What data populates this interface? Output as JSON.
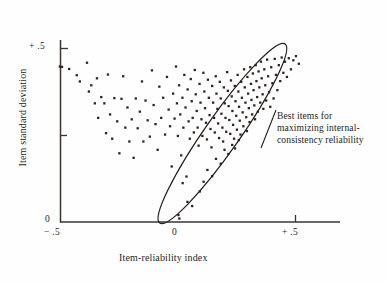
{
  "chart_data": {
    "type": "scatter",
    "title": "",
    "subtitle": "",
    "xlabel": "Item-reliability index",
    "ylabel": "Item standard deviation",
    "xlim": [
      -0.55,
      0.59
    ],
    "ylim": [
      0,
      0.515
    ],
    "grid": false,
    "legend_position": "none",
    "x_ticks": [
      -0.5,
      0,
      0.5
    ],
    "x_tick_labels": [
      "− .5",
      "0",
      "+ .5"
    ],
    "y_ticks": [
      0,
      0.25,
      0.5
    ],
    "y_tick_labels": [
      "0",
      "",
      "+ .5"
    ],
    "point_count": 191,
    "marker": "small filled square",
    "marker_color": "#2b2624",
    "points": [
      [
        -0.488,
        0.448
      ],
      [
        -0.479,
        0.447
      ],
      [
        -0.449,
        0.441
      ],
      [
        -0.417,
        0.423
      ],
      [
        -0.404,
        0.405
      ],
      [
        -0.374,
        0.459
      ],
      [
        -0.366,
        0.376
      ],
      [
        -0.356,
        0.394
      ],
      [
        -0.341,
        0.342
      ],
      [
        -0.332,
        0.414
      ],
      [
        -0.327,
        0.3
      ],
      [
        -0.314,
        0.36
      ],
      [
        -0.301,
        0.342
      ],
      [
        -0.294,
        0.256
      ],
      [
        -0.286,
        0.425
      ],
      [
        -0.277,
        0.31
      ],
      [
        -0.268,
        0.24
      ],
      [
        -0.259,
        0.357
      ],
      [
        -0.247,
        0.29
      ],
      [
        -0.238,
        0.198
      ],
      [
        -0.229,
        0.355
      ],
      [
        -0.222,
        0.42
      ],
      [
        -0.213,
        0.272
      ],
      [
        -0.204,
        0.33
      ],
      [
        -0.196,
        0.232
      ],
      [
        -0.186,
        0.296
      ],
      [
        -0.178,
        0.185
      ],
      [
        -0.169,
        0.356
      ],
      [
        -0.161,
        0.27
      ],
      [
        -0.152,
        0.318
      ],
      [
        -0.143,
        0.405
      ],
      [
        -0.137,
        0.232
      ],
      [
        -0.128,
        0.35
      ],
      [
        -0.119,
        0.293
      ],
      [
        -0.11,
        0.246
      ],
      [
        -0.101,
        0.437
      ],
      [
        -0.094,
        0.337
      ],
      [
        -0.086,
        0.282
      ],
      [
        -0.077,
        0.208
      ],
      [
        -0.07,
        0.39
      ],
      [
        -0.062,
        0.3
      ],
      [
        -0.054,
        0.358
      ],
      [
        -0.046,
        0.252
      ],
      [
        -0.038,
        0.418
      ],
      [
        -0.031,
        0.324
      ],
      [
        -0.025,
        0.276
      ],
      [
        -0.018,
        0.16
      ],
      [
        -0.012,
        0.37
      ],
      [
        -0.006,
        0.298
      ],
      [
        0.0,
        0.448
      ],
      [
        0.004,
        0.342
      ],
      [
        0.008,
        0.248
      ],
      [
        0.013,
        0.394
      ],
      [
        0.018,
        0.31
      ],
      [
        0.022,
        0.192
      ],
      [
        0.027,
        0.358
      ],
      [
        0.031,
        0.272
      ],
      [
        0.035,
        0.424
      ],
      [
        0.04,
        0.33
      ],
      [
        0.044,
        0.131
      ],
      [
        0.049,
        0.382
      ],
      [
        0.053,
        0.29
      ],
      [
        0.058,
        0.24
      ],
      [
        0.062,
        0.412
      ],
      [
        0.066,
        0.348
      ],
      [
        0.07,
        0.3
      ],
      [
        0.075,
        0.258
      ],
      [
        0.079,
        0.438
      ],
      [
        0.083,
        0.368
      ],
      [
        0.087,
        0.32
      ],
      [
        0.091,
        0.272
      ],
      [
        0.095,
        0.22
      ],
      [
        0.099,
        0.398
      ],
      [
        0.103,
        0.344
      ],
      [
        0.107,
        0.296
      ],
      [
        0.111,
        0.248
      ],
      [
        0.115,
        0.43
      ],
      [
        0.119,
        0.376
      ],
      [
        0.122,
        0.328
      ],
      [
        0.126,
        0.286
      ],
      [
        0.13,
        0.238
      ],
      [
        0.134,
        0.41
      ],
      [
        0.138,
        0.358
      ],
      [
        0.141,
        0.308
      ],
      [
        0.145,
        0.268
      ],
      [
        0.149,
        0.215
      ],
      [
        0.152,
        0.392
      ],
      [
        0.156,
        0.344
      ],
      [
        0.16,
        0.3
      ],
      [
        0.163,
        0.258
      ],
      [
        0.167,
        0.42
      ],
      [
        0.17,
        0.37
      ],
      [
        0.174,
        0.326
      ],
      [
        0.177,
        0.284
      ],
      [
        0.181,
        0.242
      ],
      [
        0.184,
        0.404
      ],
      [
        0.188,
        0.356
      ],
      [
        0.191,
        0.312
      ],
      [
        0.195,
        0.272
      ],
      [
        0.198,
        0.232
      ],
      [
        0.201,
        0.388
      ],
      [
        0.205,
        0.342
      ],
      [
        0.208,
        0.3
      ],
      [
        0.211,
        0.26
      ],
      [
        0.215,
        0.432
      ],
      [
        0.218,
        0.378
      ],
      [
        0.221,
        0.334
      ],
      [
        0.224,
        0.294
      ],
      [
        0.228,
        0.254
      ],
      [
        0.231,
        0.408
      ],
      [
        0.234,
        0.362
      ],
      [
        0.237,
        0.32
      ],
      [
        0.24,
        0.28
      ],
      [
        0.244,
        0.24
      ],
      [
        0.247,
        0.392
      ],
      [
        0.25,
        0.348
      ],
      [
        0.253,
        0.306
      ],
      [
        0.256,
        0.266
      ],
      [
        0.259,
        0.424
      ],
      [
        0.262,
        0.376
      ],
      [
        0.265,
        0.332
      ],
      [
        0.268,
        0.292
      ],
      [
        0.271,
        0.252
      ],
      [
        0.274,
        0.404
      ],
      [
        0.277,
        0.358
      ],
      [
        0.28,
        0.316
      ],
      [
        0.283,
        0.276
      ],
      [
        0.286,
        0.44
      ],
      [
        0.289,
        0.388
      ],
      [
        0.292,
        0.344
      ],
      [
        0.295,
        0.302
      ],
      [
        0.298,
        0.262
      ],
      [
        0.3,
        0.418
      ],
      [
        0.303,
        0.37
      ],
      [
        0.306,
        0.328
      ],
      [
        0.309,
        0.288
      ],
      [
        0.312,
        0.446
      ],
      [
        0.315,
        0.398
      ],
      [
        0.317,
        0.352
      ],
      [
        0.32,
        0.31
      ],
      [
        0.323,
        0.428
      ],
      [
        0.326,
        0.38
      ],
      [
        0.329,
        0.336
      ],
      [
        0.332,
        0.296
      ],
      [
        0.335,
        0.452
      ],
      [
        0.338,
        0.406
      ],
      [
        0.341,
        0.36
      ],
      [
        0.344,
        0.318
      ],
      [
        0.347,
        0.434
      ],
      [
        0.35,
        0.388
      ],
      [
        0.354,
        0.344
      ],
      [
        0.357,
        0.462
      ],
      [
        0.36,
        0.414
      ],
      [
        0.364,
        0.368
      ],
      [
        0.367,
        0.326
      ],
      [
        0.371,
        0.44
      ],
      [
        0.375,
        0.394
      ],
      [
        0.379,
        0.35
      ],
      [
        0.383,
        0.468
      ],
      [
        0.387,
        0.42
      ],
      [
        0.391,
        0.374
      ],
      [
        0.396,
        0.332
      ],
      [
        0.4,
        0.446
      ],
      [
        0.405,
        0.4
      ],
      [
        0.41,
        0.356
      ],
      [
        0.415,
        0.47
      ],
      [
        0.42,
        0.424
      ],
      [
        0.426,
        0.38
      ],
      [
        0.432,
        0.452
      ],
      [
        0.438,
        0.406
      ],
      [
        0.444,
        0.474
      ],
      [
        0.451,
        0.43
      ],
      [
        0.458,
        0.462
      ],
      [
        0.466,
        0.418
      ],
      [
        0.474,
        0.472
      ],
      [
        0.483,
        0.44
      ],
      [
        0.493,
        0.466
      ],
      [
        0.504,
        0.478
      ],
      [
        0.516,
        0.456
      ],
      [
        0.028,
        0.112
      ],
      [
        0.048,
        0.058
      ],
      [
        0.01,
        0.02
      ],
      [
        0.014,
        0.01
      ],
      [
        0.1,
        0.088
      ],
      [
        0.068,
        0.046
      ],
      [
        0.132,
        0.15
      ],
      [
        0.116,
        0.116
      ],
      [
        0.168,
        0.182
      ],
      [
        0.152,
        0.132
      ],
      [
        0.204,
        0.208
      ],
      [
        0.188,
        0.168
      ],
      [
        0.236,
        0.222
      ],
      [
        0.22,
        0.196
      ],
      [
        0.264,
        0.236
      ],
      [
        0.248,
        0.212
      ]
    ],
    "ellipse_annotation": {
      "shape": "ellipse",
      "center_x": 0.195,
      "center_y": 0.255,
      "semi_major": 0.315,
      "semi_minor": 0.073,
      "rotation_deg": -55,
      "label_lines": [
        "Best items for",
        "maximizing internal-",
        "consistency reliability"
      ]
    }
  },
  "axes": {
    "x_title": "Item-reliability index",
    "y_title": "Item standard deviation",
    "x_tick_labels": {
      "negative_half": "− .5",
      "zero": "0",
      "positive_half": "+ .5"
    },
    "y_tick_labels": {
      "positive_half": "+ .5",
      "zero": "0"
    }
  },
  "annotation": {
    "line1": "Best items for",
    "line2": "maximizing internal-",
    "line3": "consistency reliability"
  },
  "colors": {
    "ink": "#241f1d",
    "marker": "#2b2624",
    "axis": "#3a3430",
    "background": "#fefefe"
  }
}
